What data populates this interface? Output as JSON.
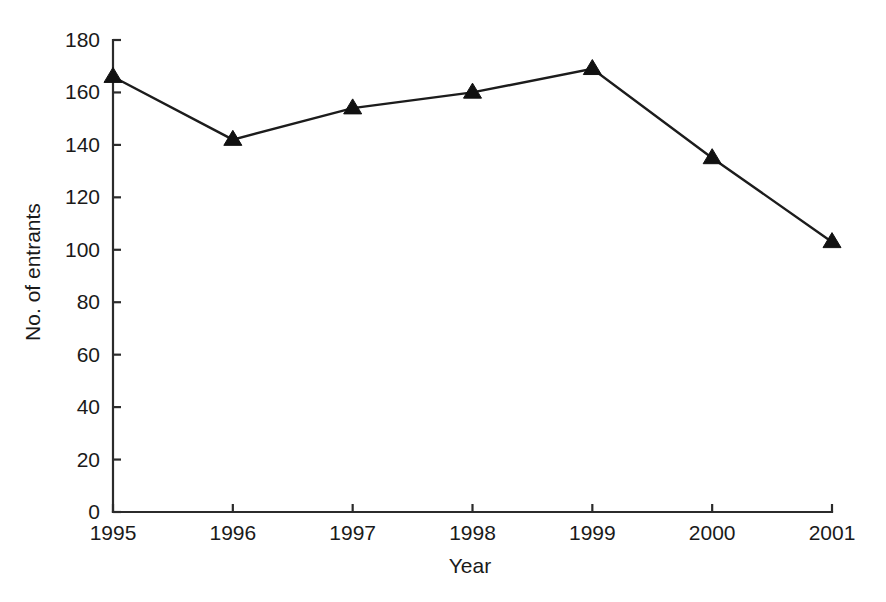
{
  "chart_data": {
    "type": "line",
    "title": "",
    "subtitle": "",
    "xlabel": "Year",
    "ylabel": "No. of entrants",
    "categories": [
      "1995",
      "1996",
      "1997",
      "1998",
      "1999",
      "2000",
      "2001"
    ],
    "x": [
      1995,
      1996,
      1997,
      1998,
      1999,
      2000,
      2001
    ],
    "values": [
      166,
      142,
      154,
      160,
      169,
      135,
      103
    ],
    "series": [
      {
        "name": "No. of entrants",
        "values": [
          166,
          142,
          154,
          160,
          169,
          135,
          103
        ],
        "marker": "triangle",
        "color": "#111111"
      }
    ],
    "xlim": [
      1995,
      2001
    ],
    "ylim": [
      0,
      180
    ],
    "yticks": [
      0,
      20,
      40,
      60,
      80,
      100,
      120,
      140,
      160,
      180
    ],
    "ytick_labels": [
      "0",
      "20",
      "40",
      "60",
      "80",
      "100",
      "120",
      "140",
      "160",
      "180"
    ],
    "xticks": [
      1995,
      1996,
      1997,
      1998,
      1999,
      2000,
      2001
    ],
    "xtick_labels": [
      "1995",
      "1996",
      "1997",
      "1998",
      "1999",
      "2000",
      "2001"
    ],
    "grid": false,
    "legend": false,
    "legend_position": "none",
    "annotations": [],
    "colors": {
      "background": "#ffffff",
      "axis": "#2b2b2b",
      "line": "#1c1c1c",
      "marker": "#111111",
      "text": "#1a1a1a"
    }
  },
  "axes": {
    "y_label": "No. of entrants",
    "x_label": "Year"
  }
}
